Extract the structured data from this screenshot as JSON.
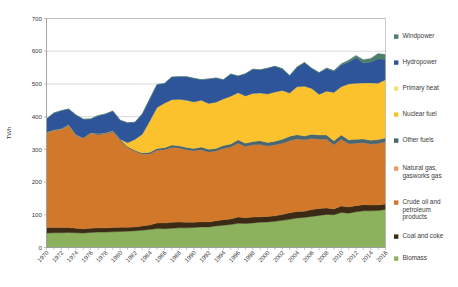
{
  "chart_data": {
    "type": "area",
    "title": "",
    "subtitle": "",
    "xlabel": "",
    "ylabel": "TWh",
    "ylim": [
      0,
      700
    ],
    "ytick_step": 100,
    "yticks": [
      "0",
      "100",
      "200",
      "300",
      "400",
      "500",
      "600",
      "700"
    ],
    "grid": true,
    "stacked": true,
    "legend_position": "right",
    "x": [
      1970,
      1971,
      1972,
      1973,
      1974,
      1975,
      1976,
      1977,
      1978,
      1979,
      1980,
      1981,
      1982,
      1983,
      1984,
      1985,
      1986,
      1987,
      1988,
      1989,
      1990,
      1991,
      1992,
      1993,
      1994,
      1995,
      1996,
      1997,
      1998,
      1999,
      2000,
      2001,
      2002,
      2003,
      2004,
      2005,
      2006,
      2007,
      2008,
      2009,
      2010,
      2011,
      2012,
      2013,
      2014,
      2015,
      2016
    ],
    "xtick_labels": [
      "1970",
      "1972",
      "1974",
      "1976",
      "1978",
      "1980",
      "1982",
      "1984",
      "1986",
      "1988",
      "1990",
      "1992",
      "1994",
      "1996",
      "1998",
      "2000",
      "2002",
      "2004",
      "2006",
      "2008",
      "2010",
      "2012",
      "2014",
      "2016"
    ],
    "series": [
      {
        "name": "Biomass",
        "color": "#8CB25E",
        "values": [
          44,
          45,
          45,
          46,
          45,
          44,
          46,
          47,
          47,
          48,
          49,
          50,
          51,
          53,
          55,
          58,
          57,
          59,
          60,
          60,
          61,
          63,
          63,
          66,
          68,
          70,
          74,
          73,
          75,
          77,
          78,
          80,
          83,
          86,
          90,
          92,
          95,
          98,
          101,
          100,
          107,
          105,
          109,
          112,
          112,
          113,
          116
        ]
      },
      {
        "name": "Coal and coke",
        "color": "#3B2B16",
        "values": [
          17,
          16,
          16,
          15,
          14,
          13,
          13,
          13,
          13,
          13,
          13,
          12,
          12,
          13,
          14,
          17,
          18,
          18,
          18,
          17,
          16,
          16,
          15,
          16,
          17,
          17,
          19,
          18,
          18,
          17,
          17,
          17,
          18,
          20,
          20,
          19,
          21,
          21,
          20,
          18,
          20,
          19,
          19,
          19,
          18,
          17,
          17
        ]
      },
      {
        "name": "Crude oil and petroleum products",
        "color": "#D2782A",
        "values": [
          289,
          296,
          300,
          312,
          284,
          276,
          290,
          285,
          287,
          293,
          266,
          244,
          231,
          219,
          217,
          222,
          224,
          229,
          226,
          222,
          219,
          220,
          214,
          213,
          218,
          220,
          226,
          218,
          221,
          221,
          215,
          217,
          218,
          220,
          222,
          218,
          217,
          212,
          210,
          196,
          204,
          193,
          191,
          189,
          186,
          188,
          190
        ]
      },
      {
        "name": "Natural gas, gasworks gas",
        "color": "#E89A6A",
        "values": [
          0,
          0,
          0,
          0,
          0,
          0,
          0,
          0,
          0,
          0,
          0,
          0,
          0,
          0,
          0,
          0,
          0,
          0,
          0,
          0,
          0,
          0,
          0,
          0,
          0,
          0,
          0,
          0,
          0,
          0,
          0,
          0,
          0,
          0,
          0,
          0,
          0,
          0,
          0,
          0,
          0,
          0,
          0,
          0,
          0,
          0,
          0
        ]
      },
      {
        "name": "Other fuels",
        "color": "#4A6670",
        "values": [
          2,
          2,
          2,
          2,
          2,
          2,
          2,
          3,
          3,
          3,
          3,
          3,
          3,
          4,
          5,
          6,
          6,
          7,
          7,
          7,
          7,
          8,
          8,
          8,
          9,
          9,
          10,
          10,
          10,
          11,
          11,
          11,
          12,
          14,
          13,
          12,
          13,
          13,
          13,
          12,
          13,
          12,
          12,
          12,
          12,
          12,
          12
        ]
      },
      {
        "name": "Nuclear fuel",
        "color": "#FBC22E",
        "values": [
          0,
          0,
          0,
          0,
          0,
          0,
          0,
          0,
          0,
          0,
          0,
          11,
          33,
          57,
          95,
          125,
          136,
          139,
          142,
          144,
          142,
          143,
          140,
          141,
          142,
          146,
          144,
          144,
          147,
          146,
          148,
          150,
          149,
          132,
          146,
          152,
          140,
          124,
          134,
          148,
          147,
          171,
          171,
          171,
          175,
          172,
          178
        ]
      },
      {
        "name": "Primary heat",
        "color": "#F2DE7E",
        "values": [
          0,
          0,
          0,
          0,
          0,
          0,
          0,
          0,
          0,
          0,
          0,
          0,
          0,
          0,
          0,
          0,
          0,
          0,
          0,
          0,
          0,
          0,
          0,
          0,
          0,
          0,
          0,
          0,
          0,
          0,
          0,
          0,
          0,
          0,
          0,
          0,
          0,
          0,
          0,
          0,
          0,
          0,
          0,
          0,
          0,
          0,
          0
        ]
      },
      {
        "name": "Hydropower",
        "color": "#2E5599",
        "values": [
          41,
          52,
          55,
          48,
          60,
          57,
          42,
          55,
          58,
          60,
          58,
          61,
          53,
          62,
          67,
          70,
          60,
          69,
          69,
          72,
          72,
          63,
          75,
          74,
          59,
          68,
          51,
          68,
          74,
          71,
          79,
          79,
          66,
          53,
          60,
          72,
          61,
          66,
          69,
          65,
          67,
          66,
          78,
          61,
          64,
          75,
          62
        ]
      },
      {
        "name": "Windpower",
        "color": "#4E7F6A",
        "values": [
          0,
          0,
          0,
          0,
          0,
          0,
          0,
          0,
          0,
          0,
          0,
          0,
          0,
          0,
          0,
          0,
          0,
          0,
          0,
          0,
          0,
          0,
          0,
          0,
          0,
          0,
          0,
          0,
          0,
          0,
          0,
          0,
          1,
          1,
          1,
          1,
          1,
          1,
          2,
          2,
          4,
          6,
          7,
          10,
          11,
          16,
          15
        ]
      }
    ],
    "legend_entries": [
      {
        "label": "Windpower",
        "color": "#4E7F6A"
      },
      {
        "label": "Hydropower",
        "color": "#2E5599"
      },
      {
        "label": "Primary heat",
        "color": "#F2DE7E"
      },
      {
        "label": "Nuclear fuel",
        "color": "#FBC22E"
      },
      {
        "label": "Other fuels",
        "color": "#4A6670"
      },
      {
        "label": "Natural gas, gasworks gas",
        "color": "#E89A6A"
      },
      {
        "label": "Crude oil and petroleum products",
        "color": "#D2782A"
      },
      {
        "label": "Coal and coke",
        "color": "#3B2B16"
      },
      {
        "label": "Biomass",
        "color": "#8CB25E"
      }
    ]
  }
}
